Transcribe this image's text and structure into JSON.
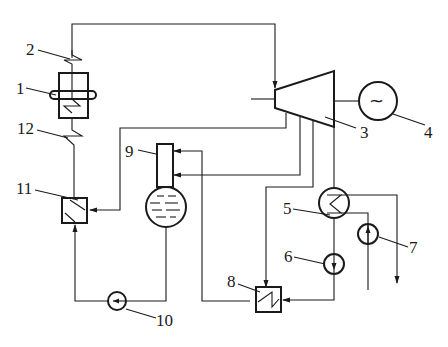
{
  "diagram": {
    "type": "steam power plant schematic (regenerative cycle)",
    "components": [
      {
        "id": "1",
        "label": "1",
        "name": "boiler"
      },
      {
        "id": "2",
        "label": "2",
        "name": "superheater"
      },
      {
        "id": "3",
        "label": "3",
        "name": "steam turbine"
      },
      {
        "id": "4",
        "label": "4",
        "name": "generator"
      },
      {
        "id": "5",
        "label": "5",
        "name": "condenser"
      },
      {
        "id": "6",
        "label": "6",
        "name": "condensate pump"
      },
      {
        "id": "7",
        "label": "7",
        "name": "circulating water pump"
      },
      {
        "id": "8",
        "label": "8",
        "name": "low-pressure heater"
      },
      {
        "id": "9",
        "label": "9",
        "name": "deaerator"
      },
      {
        "id": "10",
        "label": "10",
        "name": "feedwater pump"
      },
      {
        "id": "11",
        "label": "11",
        "name": "high-pressure heater"
      },
      {
        "id": "12",
        "label": "12",
        "name": "economizer"
      }
    ],
    "generator_symbol": "~"
  }
}
